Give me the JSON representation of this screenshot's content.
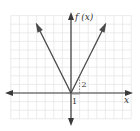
{
  "chart_data": {
    "type": "line",
    "title": "",
    "xlabel": "x",
    "ylabel": "f (x)",
    "xlim": [
      -7.5,
      7.5
    ],
    "ylim": [
      -3.5,
      9.5
    ],
    "grid": true,
    "series": [
      {
        "name": "f(x) = 2|x|",
        "points": [
          [
            -4,
            8
          ],
          [
            0,
            0
          ],
          [
            4,
            8
          ]
        ]
      }
    ],
    "annotations": [
      {
        "text": "1",
        "meaning": "run",
        "at": [
          0.5,
          -0.5
        ]
      },
      {
        "text": "2",
        "meaning": "rise",
        "at": [
          1.3,
          1
        ]
      }
    ]
  }
}
